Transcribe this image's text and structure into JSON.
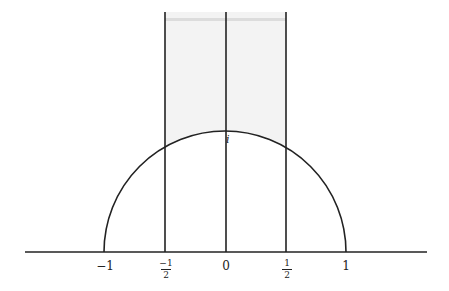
{
  "diagram": {
    "title": "",
    "colors": {
      "line": "#222222",
      "shade": "#f0f0f0",
      "shade_top": "#d8d8d8",
      "background": "#ffffff"
    },
    "point_label": "i",
    "ticks": [
      {
        "id": "minus-one",
        "text": "−1"
      },
      {
        "id": "minus-half",
        "num": "−1",
        "den": "2"
      },
      {
        "id": "zero",
        "text": "0"
      },
      {
        "id": "half",
        "num": "1",
        "den": "2"
      },
      {
        "id": "one",
        "text": "1"
      }
    ]
  }
}
